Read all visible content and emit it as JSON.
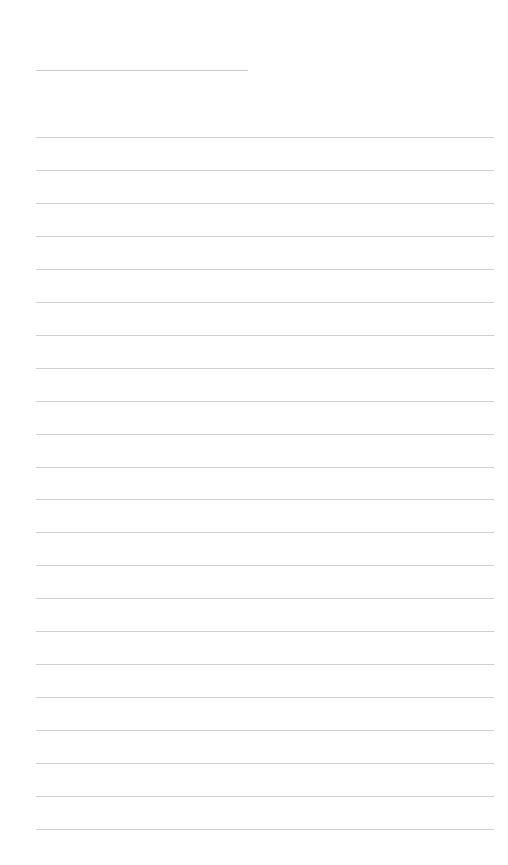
{
  "page": {
    "type": "lined-paper",
    "background": "#ffffff",
    "line_color": "#cfcfcf",
    "title_line": {
      "present": true
    },
    "ruled_lines": {
      "count": 22,
      "start_y": 137,
      "spacing": 32.95
    }
  }
}
